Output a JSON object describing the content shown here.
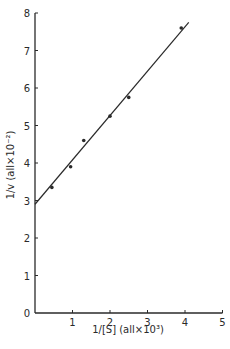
{
  "chart_data": {
    "type": "scatter",
    "title": "",
    "xlabel": "1/[S] (all×10³)",
    "ylabel": "1/v (all×10⁻²)",
    "xlim": [
      0,
      5
    ],
    "ylim": [
      0,
      8
    ],
    "x_ticks": [
      0,
      1,
      2,
      3,
      4,
      5
    ],
    "y_ticks": [
      0,
      1,
      2,
      3,
      4,
      5,
      6,
      7,
      8
    ],
    "x_tick_labels": [
      "1",
      "2",
      "3",
      "4",
      "5"
    ],
    "y_tick_labels": [
      "0",
      "1",
      "2",
      "3",
      "4",
      "5",
      "6",
      "7",
      "8"
    ],
    "grid": false,
    "legend": null,
    "series": [
      {
        "name": "data points",
        "type": "scatter",
        "x": [
          0.45,
          0.95,
          1.3,
          2.0,
          2.5,
          3.9
        ],
        "y": [
          3.35,
          3.9,
          4.6,
          5.25,
          5.75,
          7.6
        ]
      },
      {
        "name": "fit line",
        "type": "line",
        "x": [
          0,
          4.1
        ],
        "y": [
          2.9,
          7.75
        ]
      }
    ],
    "colors": {
      "ink": "#2a2a2a",
      "background": "#ffffff"
    }
  },
  "labels": {
    "x_axis_title": "1/[S] (all×10³)",
    "y_axis_title": "1/v (all×10⁻²)",
    "origin": "0"
  }
}
